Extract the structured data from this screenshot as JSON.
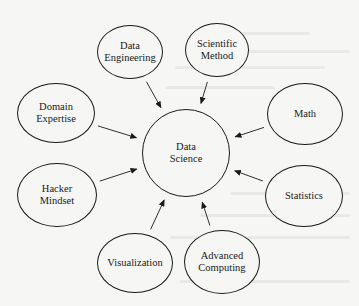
{
  "diagram": {
    "type": "hub-and-spoke",
    "colors": {
      "background": "#f6f6f4",
      "stroke": "#1a1a1a",
      "text": "#1a1a1a"
    },
    "center": {
      "id": "data-science",
      "lines": [
        "Data",
        "Science"
      ],
      "cx": 186,
      "cy": 153,
      "rx": 44,
      "ry": 44
    },
    "satellites": [
      {
        "id": "data-engineering",
        "lines": [
          "Data",
          "Engineering"
        ],
        "cx": 130,
        "cy": 52,
        "rx": 33,
        "ry": 27
      },
      {
        "id": "scientific-method",
        "lines": [
          "Scientific",
          "Method"
        ],
        "cx": 217,
        "cy": 50,
        "rx": 32,
        "ry": 27
      },
      {
        "id": "domain-expertise",
        "lines": [
          "Domain",
          "Expertise"
        ],
        "cx": 56,
        "cy": 113,
        "rx": 39,
        "ry": 30
      },
      {
        "id": "math",
        "lines": [
          "Math"
        ],
        "cx": 305,
        "cy": 114,
        "rx": 38,
        "ry": 31
      },
      {
        "id": "hacker-mindset",
        "lines": [
          "Hacker",
          "Mindset"
        ],
        "cx": 57,
        "cy": 195,
        "rx": 40,
        "ry": 32
      },
      {
        "id": "statistics",
        "lines": [
          "Statistics"
        ],
        "cx": 304,
        "cy": 196,
        "rx": 39,
        "ry": 31
      },
      {
        "id": "visualization",
        "lines": [
          "Visualization"
        ],
        "cx": 135,
        "cy": 263,
        "rx": 38,
        "ry": 30
      },
      {
        "id": "advanced-computing",
        "lines": [
          "Advanced",
          "Computing"
        ],
        "cx": 222,
        "cy": 262,
        "rx": 38,
        "ry": 32
      }
    ],
    "edges": [
      {
        "from": "data-engineering",
        "to": "data-science",
        "arrow": "end"
      },
      {
        "from": "scientific-method",
        "to": "data-science",
        "arrow": "end"
      },
      {
        "from": "domain-expertise",
        "to": "data-science",
        "arrow": "end"
      },
      {
        "from": "math",
        "to": "data-science",
        "arrow": "end"
      },
      {
        "from": "hacker-mindset",
        "to": "data-science",
        "arrow": "end"
      },
      {
        "from": "statistics",
        "to": "data-science",
        "arrow": "end"
      },
      {
        "from": "visualization",
        "to": "data-science",
        "arrow": "end"
      },
      {
        "from": "advanced-computing",
        "to": "data-science",
        "arrow": "end"
      }
    ]
  }
}
